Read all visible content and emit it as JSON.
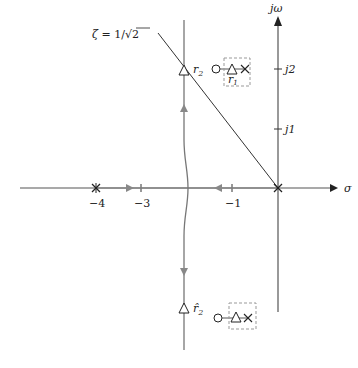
{
  "diagram": {
    "type": "root-locus",
    "axes": {
      "real_axis_label": "σ",
      "imag_axis_label": "jω",
      "real_ticks": [
        {
          "value": -4,
          "label": "−4"
        },
        {
          "value": -3,
          "label": "−3"
        },
        {
          "value": -1,
          "label": "−1"
        }
      ],
      "imag_ticks": [
        {
          "value": 1,
          "label": "j1"
        },
        {
          "value": 2,
          "label": "j2"
        }
      ]
    },
    "damping_line": {
      "label": "ζ = 1/√2",
      "label_prefix": "ζ = 1/",
      "label_sqrt": "√2"
    },
    "poles": [
      {
        "name": "pole-at-origin",
        "s": "0",
        "marker": "×"
      },
      {
        "name": "pole-at-minus-4",
        "s": "-4",
        "marker": "×"
      }
    ],
    "closed_loop_roots": {
      "r2_label": "r",
      "r2_sub": "2",
      "r2hat_label": "r̂",
      "r2hat_sub": "2",
      "r1_label": "r",
      "r1_sub": "1"
    },
    "colors": {
      "axis": "#333333",
      "locus": "#777777",
      "dashed_box": "#999999"
    }
  }
}
